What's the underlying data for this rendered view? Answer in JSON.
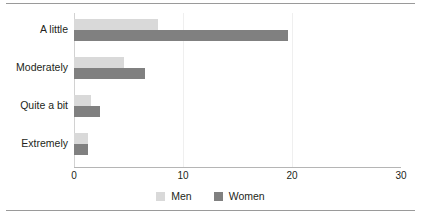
{
  "chart_data": {
    "type": "bar",
    "orientation": "horizontal",
    "title": "",
    "subtitle": "",
    "xlabel": "",
    "ylabel": "",
    "categories": [
      "A little",
      "Moderately",
      "Quite a bit",
      "Extremely"
    ],
    "series": [
      {
        "name": "Men",
        "color": "#d9d9d9",
        "values": [
          7.7,
          4.6,
          1.6,
          1.3
        ]
      },
      {
        "name": "Women",
        "color": "#808080",
        "values": [
          19.6,
          6.5,
          2.4,
          1.3
        ]
      }
    ],
    "xlim": [
      0,
      30
    ],
    "xticks": [
      0,
      10,
      20,
      30
    ],
    "xtick_labels": [
      "0",
      "10",
      "20",
      "30"
    ],
    "grid": "vertical-minor",
    "legend_position": "bottom-center",
    "annotations": []
  },
  "axis": {
    "baseline_color": "#d2d2d2",
    "gridline_color": "#efefef",
    "bottom_axis_color": "#b5b5b5"
  },
  "frame": {
    "rule_color": "#9a9a9a"
  }
}
